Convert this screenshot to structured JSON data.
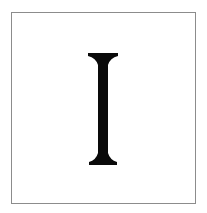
{
  "card": {
    "glyph": "I",
    "glyph_color": "#0a0a0a",
    "border_color": "#8c8c8c",
    "background": "#ffffff"
  }
}
